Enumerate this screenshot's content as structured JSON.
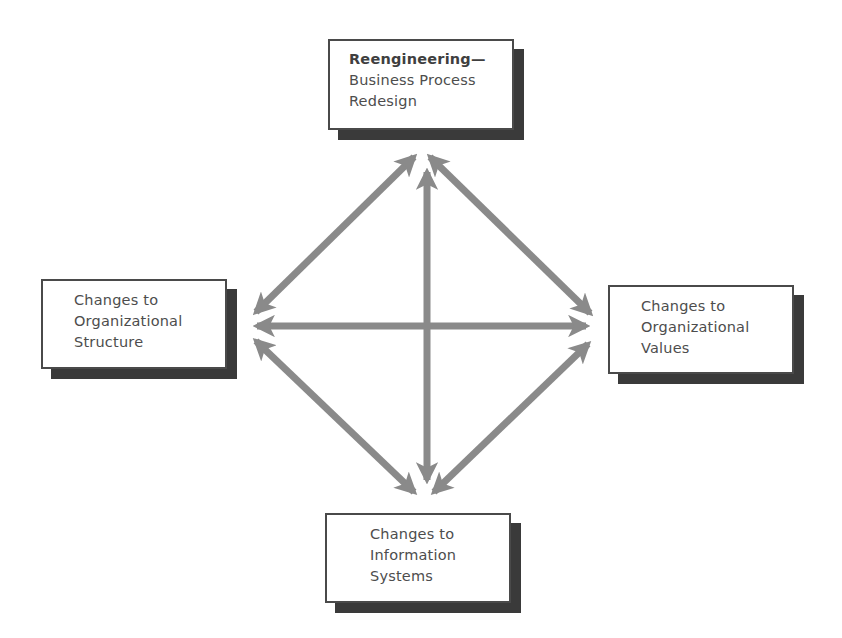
{
  "diagram": {
    "type": "relationship-diagram",
    "arrow_color": "#8a8a8a",
    "box_border_color": "#4a4a4a",
    "box_shadow_color": "#3a3a3a",
    "text_color": "#4d4d4d",
    "nodes": {
      "top": {
        "title": "Reengineering—",
        "line2": "Business Process",
        "line3": "Redesign"
      },
      "left": {
        "line1": "Changes to",
        "line2": "Organizational",
        "line3": "Structure"
      },
      "right": {
        "line1": "Changes to",
        "line2": "Organizational",
        "line3": "Values"
      },
      "bottom": {
        "line1": "Changes to",
        "line2": "Information",
        "line3": "Systems"
      }
    },
    "edges": [
      {
        "from": "top",
        "to": "left",
        "bidirectional": true
      },
      {
        "from": "top",
        "to": "right",
        "bidirectional": true
      },
      {
        "from": "top",
        "to": "bottom",
        "bidirectional": true
      },
      {
        "from": "left",
        "to": "right",
        "bidirectional": true
      },
      {
        "from": "left",
        "to": "bottom",
        "bidirectional": true
      },
      {
        "from": "right",
        "to": "bottom",
        "bidirectional": true
      }
    ]
  }
}
